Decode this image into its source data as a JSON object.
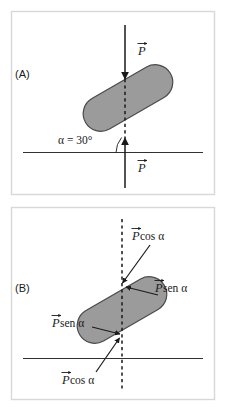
{
  "figure": {
    "background_color": "#ffffff",
    "frame_color": "#d8d8d8",
    "bar_fill_color": "#9b9b9b",
    "bar_stroke_color": "#4a4a4a",
    "line_color": "#1a1a1a",
    "inclination_degrees": 30
  },
  "panels": [
    {
      "id": "panel-a",
      "label": "(A)",
      "angle_label": "α = 30°",
      "vectors": [
        {
          "id": "weight-top",
          "symbol": "P",
          "label": "P",
          "direction": "down"
        },
        {
          "id": "weight-bottom",
          "symbol": "P",
          "label": "P",
          "direction": "up"
        }
      ]
    },
    {
      "id": "panel-b",
      "label": "(B)",
      "vectors": [
        {
          "id": "p-cos-alpha-top",
          "symbol": "P",
          "label": "P cos α",
          "component": "cos",
          "trig": "cos",
          "angle": "α"
        },
        {
          "id": "p-sen-alpha-right",
          "symbol": "P",
          "label": "P sen α",
          "component": "sen",
          "trig": "sen",
          "angle": "α"
        },
        {
          "id": "p-sen-alpha-left",
          "symbol": "P",
          "label": "P sen α",
          "component": "sen",
          "trig": "sen",
          "angle": "α"
        },
        {
          "id": "p-cos-alpha-bottom",
          "symbol": "P",
          "label": "P cos α",
          "component": "cos",
          "trig": "cos",
          "angle": "α"
        }
      ]
    }
  ],
  "text": {
    "panel_a_label": "(A)",
    "panel_b_label": "(B)",
    "alpha_equals_30": "α = 30°",
    "p_symbol": "P",
    "cos_alpha": "cos α",
    "sen_alpha": "sen α"
  }
}
